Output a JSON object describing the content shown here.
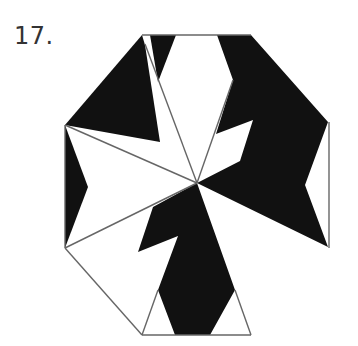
{
  "figure": {
    "number_label": "17.",
    "colors": {
      "fill": "#111111",
      "stroke": "#666666",
      "background": "#ffffff"
    },
    "center": [
      197,
      183
    ],
    "black_regions": [
      {
        "name": "top-left-wedge",
        "points": "142,35 65,125 160,142 145,45"
      },
      {
        "name": "top-spike",
        "points": "150,35 176,35 158,82"
      },
      {
        "name": "right-region",
        "points": "217,35 251,35 328,122 305,185 328,247 197,183 240,161 253,120 216,134 233,80"
      },
      {
        "name": "left-wedge",
        "points": "65,125 88,187 65,248"
      },
      {
        "name": "bottom-region",
        "points": "197,183 235,290 210,335 175,335 158,290 178,236 138,252 153,207"
      }
    ],
    "lines": [
      {
        "name": "top-edge",
        "x1": 142,
        "y1": 35,
        "x2": 251,
        "y2": 35
      },
      {
        "name": "right-edge",
        "x1": 329,
        "y1": 122,
        "x2": 329,
        "y2": 248
      },
      {
        "name": "bottom-edge",
        "x1": 142,
        "y1": 335,
        "x2": 251,
        "y2": 335
      },
      {
        "name": "left-edge",
        "x1": 65,
        "y1": 125,
        "x2": 65,
        "y2": 248
      },
      {
        "name": "bottom-left-edge",
        "x1": 65,
        "y1": 248,
        "x2": 142,
        "y2": 335
      },
      {
        "name": "spoke-left-upper",
        "x1": 65,
        "y1": 125,
        "x2": 197,
        "y2": 183
      },
      {
        "name": "spoke-left-lower",
        "x1": 65,
        "y1": 248,
        "x2": 197,
        "y2": 183
      },
      {
        "name": "spoke-top",
        "x1": 145,
        "y1": 44,
        "x2": 197,
        "y2": 183
      },
      {
        "name": "spoke-top-right",
        "x1": 233,
        "y1": 80,
        "x2": 197,
        "y2": 183
      },
      {
        "name": "bottom-left-leg",
        "x1": 142,
        "y1": 335,
        "x2": 158,
        "y2": 290
      },
      {
        "name": "bottom-right-leg",
        "x1": 251,
        "y1": 335,
        "x2": 235,
        "y2": 290
      }
    ]
  }
}
